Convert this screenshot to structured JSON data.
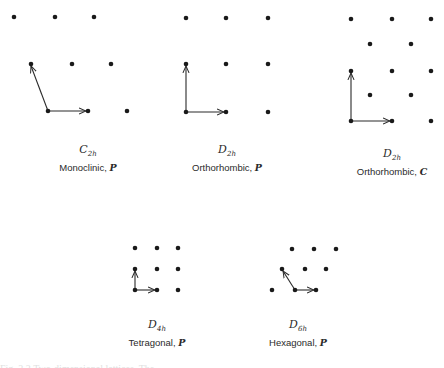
{
  "figure": {
    "lattices": [
      {
        "id": "monoclinic-p",
        "point_group": {
          "base": "C",
          "sub": "2h"
        },
        "system": "Monoclinic",
        "centering": "P",
        "label_x": 88,
        "sym_y": 143,
        "name_y": 162,
        "points": [
          [
            14,
            17
          ],
          [
            55,
            17
          ],
          [
            94,
            17
          ],
          [
            31,
            64
          ],
          [
            72,
            64
          ],
          [
            111,
            64
          ],
          [
            48,
            111
          ],
          [
            88,
            111
          ],
          [
            127,
            111
          ]
        ],
        "vectors": [
          [
            48,
            111,
            86,
            111
          ],
          [
            48,
            111,
            31,
            66
          ]
        ]
      },
      {
        "id": "orthorhombic-p",
        "point_group": {
          "base": "D",
          "sub": "2h"
        },
        "system": "Orthorhombic",
        "centering": "P",
        "label_x": 227,
        "sym_y": 143,
        "name_y": 162,
        "points": [
          [
            186,
            18
          ],
          [
            226,
            18
          ],
          [
            268,
            18
          ],
          [
            186,
            64
          ],
          [
            226,
            64
          ],
          [
            268,
            64
          ],
          [
            186,
            112
          ],
          [
            226,
            112
          ],
          [
            268,
            112
          ]
        ],
        "vectors": [
          [
            186,
            112,
            224,
            112
          ],
          [
            186,
            112,
            186,
            66
          ]
        ]
      },
      {
        "id": "orthorhombic-c",
        "point_group": {
          "base": "D",
          "sub": "2h"
        },
        "system": "Orthorhombic",
        "centering": "C",
        "label_x": 392,
        "sym_y": 147,
        "name_y": 166,
        "points": [
          [
            351,
            19
          ],
          [
            392,
            19
          ],
          [
            431,
            19
          ],
          [
            370,
            44
          ],
          [
            411,
            44
          ],
          [
            351,
            71
          ],
          [
            392,
            71
          ],
          [
            431,
            71
          ],
          [
            370,
            95
          ],
          [
            411,
            95
          ],
          [
            351,
            121
          ],
          [
            392,
            121
          ],
          [
            431,
            121
          ]
        ],
        "vectors": [
          [
            351,
            121,
            390,
            121
          ],
          [
            351,
            121,
            351,
            73
          ]
        ]
      },
      {
        "id": "tetragonal-p",
        "point_group": {
          "base": "D",
          "sub": "4h"
        },
        "system": "Tetragonal",
        "centering": "P",
        "label_x": 157,
        "sym_y": 318,
        "name_y": 337,
        "points": [
          [
            135,
            248
          ],
          [
            157,
            248
          ],
          [
            178,
            248
          ],
          [
            135,
            269
          ],
          [
            157,
            269
          ],
          [
            178,
            269
          ],
          [
            135,
            290
          ],
          [
            157,
            290
          ],
          [
            178,
            290
          ]
        ],
        "vectors": [
          [
            135,
            290,
            155,
            290
          ],
          [
            135,
            290,
            135,
            271
          ]
        ]
      },
      {
        "id": "hexagonal-p",
        "point_group": {
          "base": "D",
          "sub": "6h"
        },
        "system": "Hexagonal",
        "centering": "P",
        "label_x": 298,
        "sym_y": 318,
        "name_y": 337,
        "points": [
          [
            292,
            249
          ],
          [
            314,
            249
          ],
          [
            336,
            249
          ],
          [
            282,
            269
          ],
          [
            305,
            269
          ],
          [
            326,
            269
          ],
          [
            272,
            290
          ],
          [
            295,
            290
          ],
          [
            316,
            290
          ]
        ],
        "vectors": [
          [
            295,
            290,
            314,
            290
          ],
          [
            295,
            290,
            283,
            271
          ]
        ]
      }
    ],
    "colors": {
      "ink": "#1a1a1a",
      "background": "#ffffff"
    },
    "clipped_caption": "Fig. 2.2 Two-dimensional lattices. The ..."
  }
}
